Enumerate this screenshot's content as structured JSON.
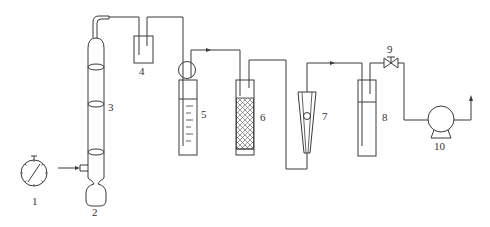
{
  "diagram": {
    "type": "process-flow-schematic",
    "stroke_color": "#3a3a3a",
    "background": "#ffffff",
    "components": [
      {
        "id": "1",
        "label": "1",
        "kind": "pressure-gauge"
      },
      {
        "id": "2",
        "label": "2",
        "kind": "bottom-bulb-flask"
      },
      {
        "id": "3",
        "label": "3",
        "kind": "packed-column"
      },
      {
        "id": "4",
        "label": "4",
        "kind": "buffer-bottle"
      },
      {
        "id": "5",
        "label": "5",
        "kind": "graduated-absorption-cylinder"
      },
      {
        "id": "6",
        "label": "6",
        "kind": "packed-drying-tube"
      },
      {
        "id": "7",
        "label": "7",
        "kind": "rotameter-flowmeter"
      },
      {
        "id": "8",
        "label": "8",
        "kind": "absorption-bottle"
      },
      {
        "id": "9",
        "label": "9",
        "kind": "valve"
      },
      {
        "id": "10",
        "label": "10",
        "kind": "vacuum-pump"
      }
    ],
    "flow_sequence": [
      "3",
      "4",
      "5",
      "6",
      "7",
      "8",
      "9",
      "10"
    ]
  }
}
